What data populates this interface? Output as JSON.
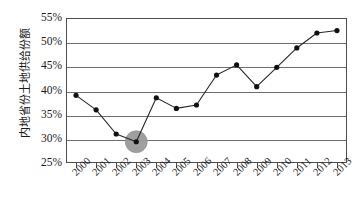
{
  "chart_data": {
    "type": "line",
    "title": "",
    "xlabel": "",
    "ylabel": "内地省份土地供给份额",
    "categories": [
      "2000",
      "2001",
      "2002",
      "2003",
      "2004",
      "2005",
      "2006",
      "2007",
      "2008",
      "2009",
      "2010",
      "2011",
      "2012",
      "2013"
    ],
    "values": [
      39.0,
      36.0,
      31.0,
      29.4,
      38.5,
      36.3,
      37.0,
      43.2,
      45.3,
      40.8,
      44.8,
      48.8,
      51.9,
      52.4
    ],
    "value_unit": "%",
    "ylim": [
      25,
      55
    ],
    "ytick_values": [
      25,
      30,
      35,
      40,
      45,
      50,
      55
    ],
    "ytick_labels": [
      "25%",
      "30%",
      "35%",
      "40%",
      "45%",
      "50%",
      "55%"
    ],
    "grid": true,
    "legend": "none",
    "annotations": [
      {
        "type": "highlight-circle",
        "category": "2003",
        "value": 29.4,
        "color": "#9a9a9a"
      }
    ],
    "series_color": "#262626",
    "marker_color": "#111111"
  }
}
